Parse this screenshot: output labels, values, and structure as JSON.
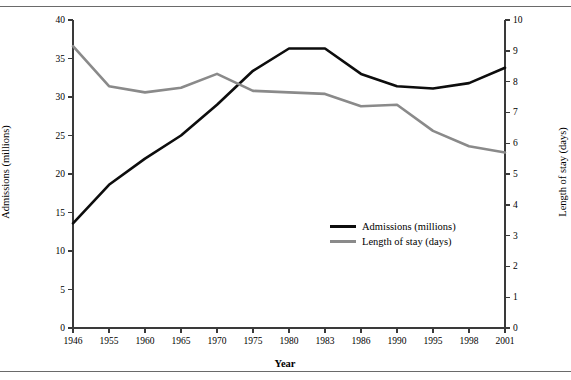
{
  "figure": {
    "has_top_rule": true,
    "has_bottom_rule": true,
    "background": "#ffffff"
  },
  "legend": {
    "position": "center-right-inside",
    "items": [
      {
        "label": "Admissions (millions)",
        "color": "#0d0d0d"
      },
      {
        "label": "Length of stay (days)",
        "color": "#8a8a8a"
      }
    ]
  },
  "chart_data": {
    "type": "line",
    "title": "",
    "subtitle": "",
    "xlabel": "Year",
    "ylabel": "Admissions (millions)",
    "y2label": "Length of stay (days)",
    "grid": false,
    "legend_position": "center-right-inside",
    "x": [
      "1946",
      "1955",
      "1960",
      "1965",
      "1970",
      "1975",
      "1980",
      "1983",
      "1986",
      "1990",
      "1995",
      "1998",
      "2001"
    ],
    "xticklabels": [
      "1946",
      "1955",
      "1960",
      "1965",
      "1970",
      "1975",
      "1980",
      "1983",
      "1986",
      "1990",
      "1995",
      "1998",
      "2001"
    ],
    "yticks": [
      0,
      5,
      10,
      15,
      20,
      25,
      30,
      35,
      40
    ],
    "ylim": [
      0,
      40
    ],
    "y2ticks": [
      0,
      1,
      2,
      3,
      4,
      5,
      6,
      7,
      8,
      9,
      10
    ],
    "y2lim": [
      0,
      10
    ],
    "series": [
      {
        "name": "Admissions (millions)",
        "axis": "left",
        "color": "#0d0d0d",
        "linewidth": 2.6,
        "values": [
          13.6,
          18.6,
          22.0,
          25.0,
          29.0,
          33.4,
          36.3,
          36.3,
          33.0,
          31.4,
          31.1,
          31.8,
          33.8
        ]
      },
      {
        "name": "Length of stay (days)",
        "axis": "right",
        "color": "#8a8a8a",
        "linewidth": 2.6,
        "values": [
          9.15,
          7.85,
          7.65,
          7.8,
          8.25,
          7.7,
          7.65,
          7.6,
          7.2,
          7.25,
          6.4,
          5.9,
          5.7
        ]
      }
    ]
  },
  "geometry": {
    "plot_left": 73,
    "plot_right": 505,
    "plot_top": 20,
    "plot_bottom": 328
  }
}
